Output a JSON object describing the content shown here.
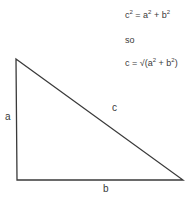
{
  "equations": {
    "line1": {
      "lhs": "c",
      "op1": " = a",
      "op2": " + b",
      "exp": "2"
    },
    "line2": "so",
    "line3": {
      "prefix": "c = ",
      "root": "√",
      "inner_a": "(a",
      "plus": " + b",
      "close": ")",
      "exp": "2"
    }
  },
  "labels": {
    "a": "a",
    "b": "b",
    "c": "c"
  },
  "triangle": {
    "vertices": [
      [
        16,
        59
      ],
      [
        17,
        180
      ],
      [
        183,
        180
      ]
    ],
    "stroke": "#3a3a3a"
  }
}
